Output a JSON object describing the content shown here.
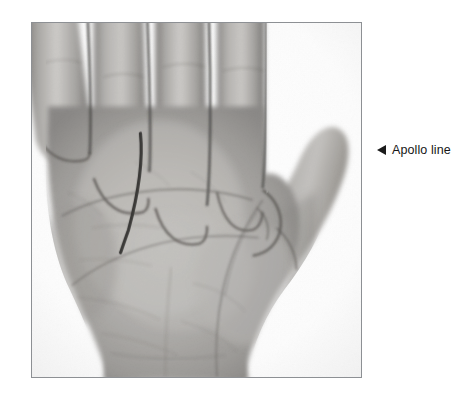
{
  "page": {
    "background_color": "#ffffff",
    "width": 465,
    "height": 408
  },
  "figure": {
    "kind": "photograph",
    "frame": {
      "border_color": "#8d9094",
      "border_width_px": 1,
      "x": 31,
      "y": 22,
      "width": 331,
      "height": 356
    },
    "image_style": "grayscale",
    "background_color": "#ffffff",
    "skin_tone_mid": "#a9a7a4",
    "skin_tone_light": "#d7d5d2",
    "skin_tone_shadow": "#6f6d6b",
    "crease_color": "#5a5755"
  },
  "marking": {
    "name": "apollo-line",
    "description": "hand-drawn dark vertical curved line on the palm beneath the ring finger",
    "color": "#3b3a38",
    "stroke_width_px": 3.2,
    "path": "M 109,111 C 112,140 106,175 97,208 C 92,222 90,228 89,231"
  },
  "annotation": {
    "arrow_icon": "left-triangle-icon",
    "arrow_direction": "left",
    "arrow_color": "#1b1b1b",
    "label": "Apollo line",
    "text_color": "#161616",
    "font_size_px": 12.5,
    "x": 377,
    "y": 143
  }
}
